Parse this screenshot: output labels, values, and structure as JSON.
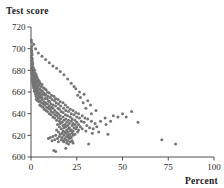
{
  "chart_data": {
    "type": "scatter",
    "title": "",
    "ylabel": "Test score",
    "xlabel": "Percent",
    "xlim": [
      0,
      100
    ],
    "ylim": [
      600,
      720
    ],
    "grid": false,
    "legend": null,
    "xticks": [
      0,
      25,
      50,
      75,
      100
    ],
    "yticks": [
      600,
      620,
      640,
      660,
      680,
      700,
      720
    ],
    "xtick_labels": [
      "0",
      "25",
      "50",
      "75",
      "100"
    ],
    "ytick_labels": [
      "600",
      "620",
      "640",
      "660",
      "680",
      "700",
      "720"
    ],
    "point_color": "#757575",
    "point_radius": 1.5,
    "n_points": 296,
    "points": [
      [
        0.2,
        708
      ],
      [
        0.3,
        706
      ],
      [
        0.4,
        702
      ],
      [
        0.2,
        700
      ],
      [
        0.5,
        698
      ],
      [
        0.3,
        697
      ],
      [
        0.6,
        695
      ],
      [
        0.4,
        694
      ],
      [
        0.2,
        692
      ],
      [
        0.7,
        691
      ],
      [
        0.5,
        690
      ],
      [
        0.3,
        689
      ],
      [
        0.8,
        688
      ],
      [
        0.6,
        687
      ],
      [
        0.4,
        686
      ],
      [
        1.0,
        686
      ],
      [
        0.3,
        685
      ],
      [
        0.7,
        684
      ],
      [
        0.5,
        683
      ],
      [
        1.2,
        683
      ],
      [
        0.9,
        682
      ],
      [
        0.4,
        682
      ],
      [
        1.5,
        681
      ],
      [
        0.6,
        681
      ],
      [
        1.0,
        680
      ],
      [
        0.3,
        680
      ],
      [
        2.0,
        680
      ],
      [
        0.8,
        679
      ],
      [
        1.3,
        679
      ],
      [
        0.5,
        678
      ],
      [
        1.8,
        678
      ],
      [
        0.7,
        678
      ],
      [
        2.4,
        677
      ],
      [
        1.1,
        677
      ],
      [
        0.4,
        677
      ],
      [
        1.6,
        676
      ],
      [
        0.9,
        676
      ],
      [
        2.8,
        676
      ],
      [
        0.6,
        675
      ],
      [
        1.4,
        675
      ],
      [
        2.1,
        675
      ],
      [
        0.8,
        674
      ],
      [
        3.2,
        674
      ],
      [
        1.7,
        674
      ],
      [
        1.0,
        673
      ],
      [
        2.5,
        673
      ],
      [
        0.5,
        673
      ],
      [
        1.3,
        672
      ],
      [
        3.6,
        672
      ],
      [
        2.0,
        672
      ],
      [
        0.9,
        671
      ],
      [
        4.0,
        671
      ],
      [
        1.6,
        671
      ],
      [
        2.9,
        670
      ],
      [
        1.2,
        670
      ],
      [
        0.7,
        670
      ],
      [
        4.5,
        670
      ],
      [
        2.3,
        669
      ],
      [
        1.9,
        669
      ],
      [
        3.4,
        669
      ],
      [
        1.0,
        668
      ],
      [
        5.0,
        668
      ],
      [
        2.7,
        668
      ],
      [
        1.5,
        667
      ],
      [
        3.9,
        667
      ],
      [
        2.1,
        667
      ],
      [
        6.0,
        667
      ],
      [
        1.2,
        666
      ],
      [
        4.3,
        666
      ],
      [
        2.5,
        666
      ],
      [
        3.1,
        665
      ],
      [
        1.8,
        665
      ],
      [
        5.5,
        665
      ],
      [
        2.2,
        664
      ],
      [
        6.8,
        664
      ],
      [
        3.6,
        664
      ],
      [
        1.4,
        664
      ],
      [
        4.7,
        663
      ],
      [
        2.8,
        663
      ],
      [
        7.5,
        663
      ],
      [
        2.0,
        662
      ],
      [
        5.2,
        662
      ],
      [
        3.3,
        662
      ],
      [
        8.2,
        662
      ],
      [
        1.7,
        661
      ],
      [
        4.0,
        661
      ],
      [
        6.2,
        661
      ],
      [
        2.6,
        661
      ],
      [
        9.0,
        660
      ],
      [
        3.7,
        660
      ],
      [
        5.7,
        660
      ],
      [
        2.2,
        660
      ],
      [
        7.0,
        659
      ],
      [
        4.4,
        659
      ],
      [
        10.0,
        659
      ],
      [
        3.0,
        659
      ],
      [
        6.5,
        658
      ],
      [
        2.5,
        658
      ],
      [
        8.0,
        658
      ],
      [
        4.9,
        658
      ],
      [
        11.2,
        657
      ],
      [
        3.5,
        657
      ],
      [
        7.6,
        657
      ],
      [
        5.4,
        657
      ],
      [
        2.8,
        656
      ],
      [
        9.2,
        656
      ],
      [
        4.2,
        656
      ],
      [
        12.5,
        656
      ],
      [
        6.0,
        655
      ],
      [
        3.2,
        655
      ],
      [
        10.5,
        655
      ],
      [
        5.0,
        655
      ],
      [
        7.8,
        654
      ],
      [
        13.5,
        654
      ],
      [
        4.0,
        654
      ],
      [
        8.8,
        654
      ],
      [
        2.9,
        653
      ],
      [
        11.5,
        653
      ],
      [
        6.2,
        653
      ],
      [
        14.8,
        653
      ],
      [
        5.0,
        652
      ],
      [
        9.5,
        652
      ],
      [
        3.6,
        652
      ],
      [
        12.8,
        652
      ],
      [
        7.2,
        651
      ],
      [
        16.0,
        651
      ],
      [
        4.5,
        651
      ],
      [
        10.2,
        651
      ],
      [
        8.0,
        650
      ],
      [
        13.8,
        650
      ],
      [
        5.8,
        650
      ],
      [
        17.5,
        650
      ],
      [
        11.0,
        649
      ],
      [
        6.8,
        649
      ],
      [
        15.0,
        649
      ],
      [
        9.0,
        649
      ],
      [
        4.8,
        648
      ],
      [
        12.2,
        648
      ],
      [
        18.8,
        648
      ],
      [
        7.5,
        648
      ],
      [
        10.0,
        647
      ],
      [
        16.2,
        647
      ],
      [
        5.5,
        647
      ],
      [
        13.5,
        647
      ],
      [
        8.5,
        646
      ],
      [
        20.0,
        646
      ],
      [
        11.2,
        646
      ],
      [
        6.5,
        646
      ],
      [
        14.8,
        645
      ],
      [
        9.5,
        645
      ],
      [
        17.8,
        645
      ],
      [
        12.0,
        645
      ],
      [
        7.2,
        644
      ],
      [
        21.5,
        644
      ],
      [
        15.5,
        644
      ],
      [
        10.5,
        644
      ],
      [
        8.2,
        643
      ],
      [
        19.0,
        643
      ],
      [
        13.0,
        643
      ],
      [
        23.0,
        643
      ],
      [
        11.0,
        642
      ],
      [
        16.5,
        642
      ],
      [
        9.0,
        642
      ],
      [
        20.5,
        642
      ],
      [
        14.0,
        641
      ],
      [
        24.5,
        641
      ],
      [
        12.2,
        641
      ],
      [
        17.5,
        641
      ],
      [
        10.0,
        640
      ],
      [
        22.0,
        640
      ],
      [
        15.0,
        640
      ],
      [
        26.0,
        640
      ],
      [
        13.0,
        639
      ],
      [
        18.8,
        639
      ],
      [
        11.0,
        639
      ],
      [
        23.5,
        639
      ],
      [
        16.0,
        638
      ],
      [
        28.0,
        638
      ],
      [
        14.2,
        638
      ],
      [
        20.0,
        638
      ],
      [
        12.0,
        637
      ],
      [
        25.0,
        637
      ],
      [
        17.5,
        637
      ],
      [
        21.5,
        637
      ],
      [
        15.0,
        636
      ],
      [
        29.5,
        636
      ],
      [
        13.0,
        636
      ],
      [
        26.5,
        636
      ],
      [
        19.0,
        635
      ],
      [
        22.5,
        635
      ],
      [
        16.2,
        635
      ],
      [
        31.0,
        635
      ],
      [
        14.0,
        634
      ],
      [
        24.0,
        634
      ],
      [
        20.5,
        634
      ],
      [
        18.0,
        634
      ],
      [
        27.5,
        633
      ],
      [
        15.5,
        633
      ],
      [
        22.0,
        633
      ],
      [
        33.0,
        633
      ],
      [
        17.0,
        632
      ],
      [
        25.0,
        632
      ],
      [
        19.5,
        632
      ],
      [
        29.0,
        632
      ],
      [
        16.0,
        631
      ],
      [
        23.0,
        631
      ],
      [
        21.0,
        631
      ],
      [
        35.0,
        631
      ],
      [
        18.5,
        630
      ],
      [
        26.0,
        630
      ],
      [
        14.5,
        630
      ],
      [
        24.0,
        630
      ],
      [
        20.0,
        629
      ],
      [
        30.5,
        629
      ],
      [
        17.5,
        629
      ],
      [
        22.5,
        629
      ],
      [
        19.0,
        628
      ],
      [
        27.0,
        628
      ],
      [
        15.5,
        628
      ],
      [
        25.0,
        628
      ],
      [
        21.0,
        627
      ],
      [
        32.0,
        627
      ],
      [
        18.0,
        627
      ],
      [
        23.5,
        627
      ],
      [
        16.5,
        626
      ],
      [
        28.0,
        626
      ],
      [
        20.5,
        626
      ],
      [
        24.5,
        626
      ],
      [
        19.5,
        625
      ],
      [
        22.0,
        625
      ],
      [
        14.0,
        625
      ],
      [
        26.0,
        625
      ],
      [
        17.5,
        624
      ],
      [
        21.5,
        624
      ],
      [
        30.0,
        624
      ],
      [
        23.0,
        624
      ],
      [
        18.5,
        623
      ],
      [
        20.0,
        623
      ],
      [
        25.5,
        623
      ],
      [
        15.0,
        623
      ],
      [
        22.5,
        622
      ],
      [
        19.0,
        622
      ],
      [
        33.5,
        622
      ],
      [
        17.0,
        622
      ],
      [
        21.0,
        621
      ],
      [
        24.0,
        621
      ],
      [
        16.0,
        621
      ],
      [
        42.0,
        621
      ],
      [
        20.0,
        620
      ],
      [
        18.0,
        620
      ],
      [
        13.5,
        620
      ],
      [
        23.0,
        620
      ],
      [
        19.5,
        619
      ],
      [
        21.5,
        619
      ],
      [
        15.5,
        619
      ],
      [
        12.0,
        619
      ],
      [
        10.5,
        618
      ],
      [
        17.0,
        618
      ],
      [
        22.0,
        618
      ],
      [
        20.5,
        618
      ],
      [
        14.5,
        617
      ],
      [
        18.5,
        617
      ],
      [
        9.5,
        617
      ],
      [
        21.0,
        617
      ],
      [
        16.5,
        616
      ],
      [
        19.0,
        616
      ],
      [
        13.0,
        616
      ],
      [
        71.5,
        616
      ],
      [
        20.0,
        615
      ],
      [
        17.5,
        615
      ],
      [
        11.5,
        615
      ],
      [
        22.5,
        615
      ],
      [
        18.0,
        614
      ],
      [
        15.0,
        614
      ],
      [
        21.5,
        614
      ],
      [
        79.0,
        612
      ],
      [
        23.0,
        613
      ],
      [
        19.5,
        613
      ],
      [
        31.5,
        612
      ],
      [
        20.5,
        612
      ],
      [
        12.5,
        606
      ],
      [
        13.5,
        605
      ],
      [
        19.0,
        608
      ],
      [
        36.0,
        628
      ],
      [
        38.0,
        633
      ],
      [
        40.5,
        636
      ],
      [
        43.5,
        633
      ],
      [
        45.0,
        638
      ],
      [
        47.5,
        637
      ],
      [
        50.0,
        640
      ],
      [
        52.0,
        637
      ],
      [
        55.0,
        642
      ],
      [
        58.5,
        632
      ],
      [
        34.0,
        626
      ],
      [
        37.0,
        623
      ],
      [
        41.0,
        630
      ],
      [
        30.0,
        645
      ],
      [
        32.5,
        648
      ],
      [
        35.5,
        643
      ],
      [
        28.5,
        650
      ],
      [
        33.0,
        640
      ],
      [
        27.0,
        655
      ],
      [
        29.0,
        658
      ],
      [
        31.0,
        652
      ],
      [
        26.5,
        660
      ],
      [
        24.5,
        663
      ],
      [
        25.5,
        657
      ],
      [
        23.5,
        665
      ],
      [
        22.0,
        668
      ],
      [
        20.0,
        672
      ],
      [
        18.0,
        676
      ],
      [
        16.0,
        679
      ],
      [
        14.0,
        682
      ],
      [
        12.0,
        684
      ],
      [
        10.0,
        687
      ],
      [
        8.0,
        690
      ],
      [
        6.0,
        693
      ],
      [
        4.0,
        696
      ],
      [
        2.5,
        700
      ],
      [
        1.5,
        704
      ]
    ]
  }
}
